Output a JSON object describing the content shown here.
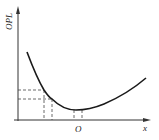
{
  "diagram": {
    "type": "curve-plot",
    "y_axis_label": "OPL",
    "x_axis_label": "x",
    "x_marker_label": "O",
    "colors": {
      "curve": "#1a1a1a",
      "axis": "#333333",
      "dashed": "#444444",
      "background": "#ffffff"
    }
  }
}
